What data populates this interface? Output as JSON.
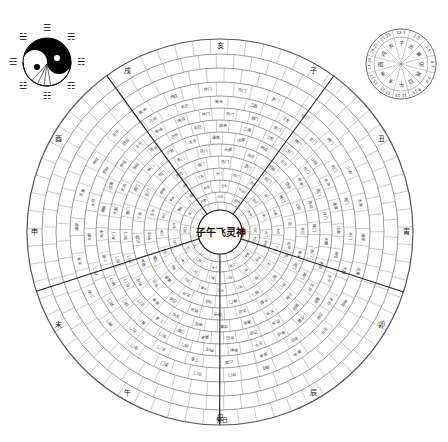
{
  "title": "子午飞灵神",
  "yinyang": {
    "trigrams": [
      "☰",
      "☴",
      "☵",
      "☶",
      "☷",
      "☳",
      "☲",
      "☱"
    ],
    "labels": [
      "乾",
      "巽",
      "坎",
      "艮",
      "坤",
      "震",
      "离",
      "兑"
    ]
  },
  "clock_dial": {
    "branches": [
      "子",
      "丑",
      "寅",
      "卯",
      "辰",
      "巳",
      "午",
      "未",
      "申",
      "酉",
      "戌",
      "亥"
    ],
    "hours": [
      "23-1",
      "1-3",
      "3-5",
      "5-7",
      "7-9",
      "9-11",
      "11-13",
      "13-15",
      "15-17",
      "17-19",
      "19-21",
      "21-23"
    ]
  },
  "main_wheel": {
    "center_label": "子午飞灵神",
    "sector_labels_top": [
      "乙",
      "（庚）",
      "丁",
      "巳",
      "乙庚"
    ],
    "sample_cells": [
      "戊寅",
      "己卯",
      "甲戌",
      "辛巳",
      "壬午",
      "癸未",
      "甲申",
      "乙酉",
      "丙戌",
      "丁亥",
      "休门",
      "生门",
      "伤门",
      "杜门",
      "景门",
      "死门",
      "惊门",
      "开门",
      "神门",
      "大都",
      "少府",
      "太白",
      "太冲",
      "阴谷",
      "涌泉",
      "然谷"
    ],
    "outer_labels": [
      "巳",
      "午",
      "未",
      "申",
      "酉",
      "戌",
      "亥",
      "子",
      "丑",
      "寅",
      "卯",
      "辰"
    ],
    "bottom_label": "癸日",
    "rings": 14,
    "spokes": 5
  },
  "colors": {
    "ink": "#222222",
    "line": "#555555",
    "paper": "#ffffff"
  }
}
